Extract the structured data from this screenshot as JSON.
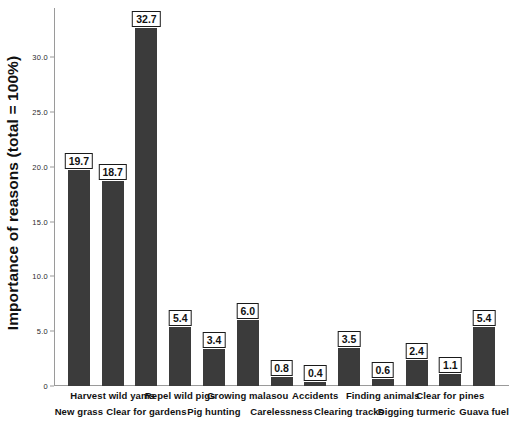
{
  "chart_data": {
    "type": "bar",
    "title": "",
    "xlabel": "",
    "ylabel": "Importance of reasons (total = 100%)",
    "ylim": [
      0,
      34.5
    ],
    "yticks": [
      0,
      5,
      10,
      15,
      20,
      25,
      30
    ],
    "ytick_labels": [
      "0",
      "5.0",
      "10.0",
      "15.0",
      "20.0",
      "25.0",
      "30.0"
    ],
    "grid": false,
    "legend": "none",
    "bar_color": "#3b3b3b",
    "categories": [
      "New grass",
      "Harvest wild yams",
      "Clear for gardens",
      "Repel wild pigs",
      "Pig hunting",
      "Growing malasou",
      "Carelessness",
      "Accidents",
      "Clearing tracks",
      "Finding animals",
      "Digging turmeric",
      "Clear for pines",
      "Guava fuel"
    ],
    "values": [
      19.7,
      18.7,
      32.7,
      5.4,
      3.4,
      6.0,
      0.8,
      0.4,
      3.5,
      0.6,
      2.4,
      1.1,
      5.4
    ],
    "value_labels": [
      "19.7",
      "18.7",
      "32.7",
      "5.4",
      "3.4",
      "6.0",
      "0.8",
      "0.4",
      "3.5",
      "0.6",
      "2.4",
      "1.1",
      "5.4"
    ],
    "label_rows": [
      1,
      0,
      1,
      0,
      1,
      0,
      1,
      0,
      1,
      0,
      1,
      0,
      1
    ]
  }
}
